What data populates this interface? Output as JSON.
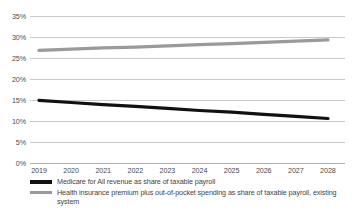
{
  "chart_data": {
    "type": "line",
    "title": "",
    "subtitle": "",
    "xlabel": "",
    "ylabel": "",
    "x": [
      2019,
      2020,
      2021,
      2022,
      2023,
      2024,
      2025,
      2026,
      2027,
      2028
    ],
    "xtick_labels": [
      "2019",
      "2020",
      "2021",
      "2022",
      "2023",
      "2024",
      "2025",
      "2026",
      "2027",
      "2028"
    ],
    "ytick_labels": [
      "0%",
      "5%",
      "10%",
      "15%",
      "20%",
      "25%",
      "30%",
      "35%"
    ],
    "yticks": [
      0,
      5,
      10,
      15,
      20,
      25,
      30,
      35
    ],
    "ylim": [
      0,
      35
    ],
    "grid": "horizontal",
    "legend_position": "bottom-left",
    "series": [
      {
        "name": "Medicare for All revenue as share of taxable payroll",
        "color": "#111111",
        "line_width": 3.2,
        "swatch": "black-thick-line",
        "values": [
          14.9,
          14.4,
          13.9,
          13.5,
          13.0,
          12.5,
          12.1,
          11.6,
          11.1,
          10.6
        ]
      },
      {
        "name": "Health insurance premium plus out-of-pocket spending as share of taxable payroll, existing system",
        "color": "#9a9a9a",
        "line_width": 3.2,
        "swatch": "gray-thick-line",
        "values": [
          26.8,
          27.1,
          27.4,
          27.6,
          27.9,
          28.2,
          28.4,
          28.7,
          29.0,
          29.3
        ]
      }
    ],
    "colors": {
      "series_1": "#111111",
      "series_2": "#9a9a9a",
      "gridline": "#c9c9c9",
      "axis": "#b0b0b0",
      "text": "#4a4a4a",
      "background": "#ffffff"
    }
  },
  "legend": {
    "items": [
      {
        "label": "Medicare for All revenue as share of taxable payroll"
      },
      {
        "label": "Health insurance premium plus out-of-pocket spending as share of taxable payroll, existing system"
      }
    ]
  }
}
